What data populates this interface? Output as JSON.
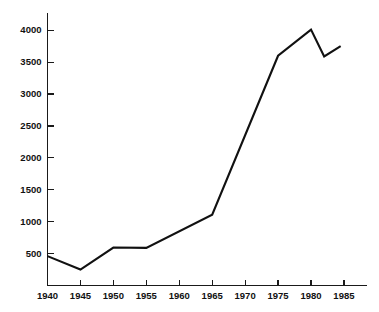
{
  "chart_data": {
    "type": "line",
    "title": "",
    "subtitle": "",
    "xlabel": "",
    "ylabel": "",
    "grid": false,
    "legend": false,
    "legend_position": "none",
    "xlim": [
      1940,
      1988.5
    ],
    "ylim": [
      0,
      4270
    ],
    "xticks": [
      1940,
      1945,
      1950,
      1955,
      1960,
      1965,
      1970,
      1975,
      1980,
      1985
    ],
    "xtick_labels": [
      "1940",
      "1945",
      "1950",
      "1955",
      "1960",
      "1965",
      "1970",
      "1975",
      "1980",
      "1985"
    ],
    "yticks": [
      500,
      1000,
      1500,
      2000,
      2500,
      3000,
      3500,
      4000
    ],
    "ytick_labels": [
      "500",
      "1000",
      "1500",
      "2000",
      "2500",
      "3000",
      "3500",
      "4000"
    ],
    "series": [
      {
        "name": "series-1",
        "color": "#111111",
        "x": [
          1940,
          1945,
          1950,
          1955,
          1965,
          1975,
          1980,
          1982,
          1984.5
        ],
        "values": [
          460,
          250,
          595,
          590,
          1110,
          3600,
          4010,
          3590,
          3750
        ]
      }
    ]
  },
  "axes": {
    "line_color": "#1a1a1a",
    "tick_color": "#1a1a1a"
  }
}
